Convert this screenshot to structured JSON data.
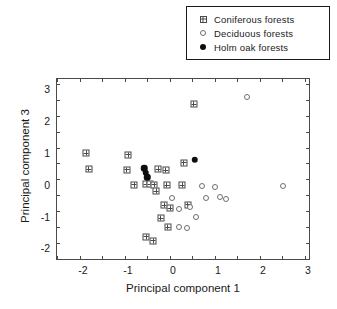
{
  "chart_data": {
    "type": "scatter",
    "title": "",
    "xlabel": "Principal component 1",
    "ylabel": "Principal component 3",
    "xlim": [
      -2.6,
      3.0
    ],
    "ylim": [
      -2.3,
      3.35
    ],
    "xticks": [
      -2,
      -1,
      0,
      1,
      2,
      3
    ],
    "yticks": [
      -2,
      -1,
      0,
      1,
      2,
      3
    ],
    "xtick_labels": [
      "-2",
      "-1",
      "0",
      "1",
      "2",
      "3"
    ],
    "ytick_labels": [
      "-2",
      "-1",
      "0",
      "1",
      "2",
      "3"
    ],
    "grid": false,
    "legend_position": "top-right",
    "series": [
      {
        "name": "Coniferous forests",
        "marker": "crossed-square",
        "color": "#4a4a4a",
        "points": [
          [
            -1.95,
            1.02
          ],
          [
            -1.9,
            0.52
          ],
          [
            -1.02,
            0.98
          ],
          [
            -1.05,
            0.5
          ],
          [
            -0.88,
            0.03
          ],
          [
            -0.62,
            0.05
          ],
          [
            -0.53,
            0.04
          ],
          [
            -0.44,
            0.03
          ],
          [
            -0.39,
            -0.18
          ],
          [
            -0.35,
            0.52
          ],
          [
            -0.18,
            0.48
          ],
          [
            -0.16,
            0.02
          ],
          [
            -0.22,
            -0.62
          ],
          [
            -0.08,
            -0.7
          ],
          [
            -0.3,
            -1.02
          ],
          [
            -0.14,
            -1.3
          ],
          [
            0.22,
            0.72
          ],
          [
            0.18,
            0.02
          ],
          [
            0.3,
            -0.6
          ],
          [
            0.44,
            2.55
          ],
          [
            -0.62,
            -1.6
          ],
          [
            -0.46,
            -1.72
          ]
        ]
      },
      {
        "name": "Deciduous forests",
        "marker": "open-circle",
        "color": "#6e6e6e",
        "points": [
          [
            -0.05,
            -0.38
          ],
          [
            0.12,
            -0.72
          ],
          [
            0.62,
            -0.02
          ],
          [
            0.9,
            -0.04
          ],
          [
            1.02,
            -0.36
          ],
          [
            1.16,
            -0.42
          ],
          [
            0.7,
            -0.4
          ],
          [
            0.36,
            -0.68
          ],
          [
            0.48,
            -0.98
          ],
          [
            1.62,
            2.8
          ],
          [
            2.42,
            -0.02
          ],
          [
            0.1,
            -1.28
          ],
          [
            0.28,
            -1.34
          ]
        ]
      },
      {
        "name": "Holm oak forests",
        "marker": "filled-circle",
        "color": "#0d0d0d",
        "points": [
          [
            -0.66,
            0.55
          ],
          [
            -0.63,
            0.4
          ],
          [
            -0.6,
            0.26
          ],
          [
            0.46,
            0.82
          ]
        ]
      }
    ]
  },
  "legend": {
    "entries": [
      {
        "label": "Coniferous forests",
        "marker": "crossed-square-icon"
      },
      {
        "label": "Deciduous forests",
        "marker": "open-circle-icon"
      },
      {
        "label": "Holm oak forests",
        "marker": "filled-circle-icon"
      }
    ]
  }
}
